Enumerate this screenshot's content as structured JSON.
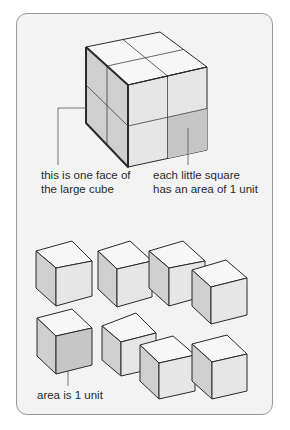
{
  "labels": {
    "face_line1": "this is one face of",
    "face_line2": "the large cube",
    "square_line1": "each little square",
    "square_line2": "has an area of 1 unit",
    "unit_area": "area is 1 unit"
  },
  "colors": {
    "frame_border": "#9a9a9a",
    "frame_bg": "#f3f3f3",
    "top_face": "#f7f7f7",
    "left_face": "#cfcfcf",
    "right_face": "#e6e6e6",
    "highlight_face": "#c6c6c6",
    "edge": "#2a2a2a"
  },
  "large_cube": {
    "grid": "2x2x2",
    "highlighted_square": "right face, bottom-right"
  },
  "small_cubes": {
    "count": 8,
    "highlighted_index": 5
  }
}
